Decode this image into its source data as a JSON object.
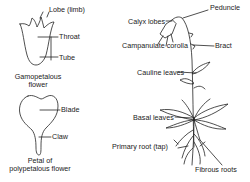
{
  "diagram": {
    "left_top": {
      "labels": {
        "lobe": "Lobe (limb)",
        "throat": "Throat",
        "tube": "Tube"
      },
      "caption_line1": "Gamopetalous",
      "caption_line2": "flower"
    },
    "left_bottom": {
      "labels": {
        "blade": "Blade",
        "claw": "Claw"
      },
      "caption_line1": "Petal of",
      "caption_line2": "polypetalous flower"
    },
    "right_plant": {
      "labels": {
        "peduncle": "Peduncle",
        "calyx_lobes": "Calyx lobes",
        "campanulate_corolla": "Campanulate corolla",
        "bract": "Bract",
        "cauline_leaves": "Cauline leaves",
        "basal_leaves": "Basal leaves",
        "primary_root": "Primary root (tap)",
        "fibrous_roots": "Fibrous roots"
      }
    }
  }
}
